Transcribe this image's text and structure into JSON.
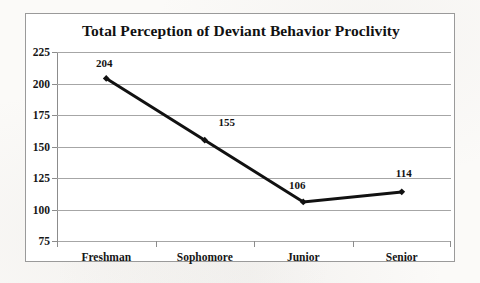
{
  "chart_data": {
    "type": "line",
    "title": "Total Perception of Deviant Behavior Proclivity",
    "categories": [
      "Freshman",
      "Sophomore",
      "Junior",
      "Senior"
    ],
    "values": [
      204,
      155,
      106,
      114
    ],
    "point_labels": [
      "204",
      "155",
      "106",
      "114"
    ],
    "xlabel": "",
    "ylabel": "",
    "ylim": [
      75,
      225
    ],
    "yticks": [
      225,
      200,
      175,
      150,
      125,
      100,
      75
    ],
    "ytick_labels": [
      "225",
      "200",
      "175",
      "150",
      "125",
      "100",
      "75"
    ],
    "grid": "horizontal",
    "legend": "none",
    "series_color": "#111111",
    "gridline_color": "#a6a6a6",
    "plot_background": "#ffffff",
    "marker": "diamond"
  }
}
